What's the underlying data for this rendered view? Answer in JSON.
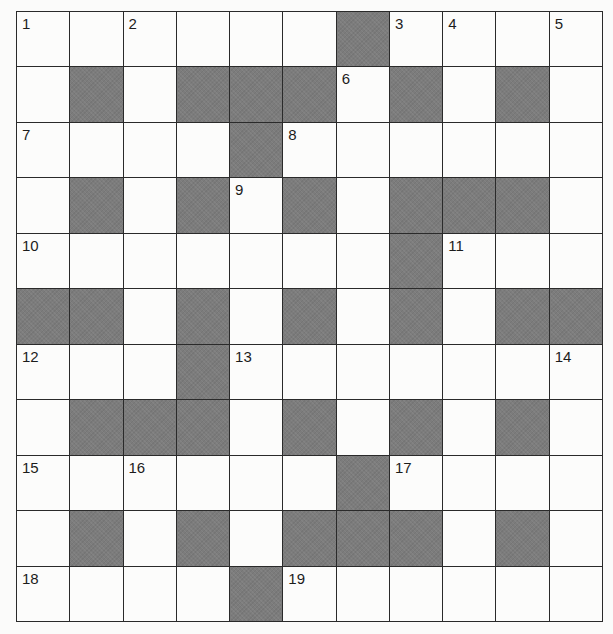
{
  "puzzle": {
    "rows": 11,
    "cols": 11,
    "colors": {
      "block": "#7c7c7c",
      "cell": "#fcfcfb",
      "grid_line": "#2a2a2a",
      "number": "#1c1c1c"
    },
    "layout": [
      [
        "1",
        ".",
        "2",
        ".",
        ".",
        ".",
        "#",
        "3",
        "4",
        ".",
        "5"
      ],
      [
        ".",
        "#",
        ".",
        "#",
        "#",
        "#",
        "6",
        "#",
        ".",
        "#",
        "."
      ],
      [
        "7",
        ".",
        ".",
        ".",
        "#",
        "8",
        ".",
        ".",
        ".",
        ".",
        "."
      ],
      [
        ".",
        "#",
        ".",
        "#",
        "9",
        "#",
        ".",
        "#",
        "#",
        "#",
        "."
      ],
      [
        "10",
        ".",
        ".",
        ".",
        ".",
        ".",
        ".",
        "#",
        "11",
        ".",
        "."
      ],
      [
        "#",
        "#",
        ".",
        "#",
        ".",
        "#",
        ".",
        "#",
        ".",
        "#",
        "#"
      ],
      [
        "12",
        ".",
        ".",
        "#",
        "13",
        ".",
        ".",
        ".",
        ".",
        ".",
        "14"
      ],
      [
        ".",
        "#",
        "#",
        "#",
        ".",
        "#",
        ".",
        "#",
        ".",
        "#",
        "."
      ],
      [
        "15",
        ".",
        "16",
        ".",
        ".",
        ".",
        "#",
        "17",
        ".",
        ".",
        "."
      ],
      [
        ".",
        "#",
        ".",
        "#",
        ".",
        "#",
        "#",
        "#",
        ".",
        "#",
        "."
      ],
      [
        "18",
        ".",
        ".",
        ".",
        "#",
        "19",
        ".",
        ".",
        ".",
        ".",
        "."
      ]
    ],
    "letters": []
  }
}
